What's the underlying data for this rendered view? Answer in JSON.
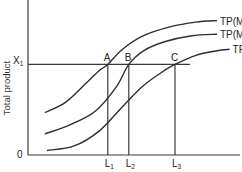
{
  "chart_data": {
    "type": "line",
    "title": "",
    "xlabel": "",
    "ylabel": "Total product",
    "origin_label": "0",
    "grid": false,
    "legend": "none",
    "x_range": [
      0,
      10
    ],
    "y_range": [
      0,
      10
    ],
    "level_line": {
      "label": "X",
      "subscript": "1",
      "y": 6
    },
    "series": [
      {
        "name": "TP(M3)",
        "label_main": "TP(M",
        "label_sub": "3",
        "label_end": ")",
        "points": [
          [
            0.8,
            2.8
          ],
          [
            1.8,
            3.5
          ],
          [
            2.8,
            4.8
          ],
          [
            3.4,
            5.6
          ],
          [
            3.8,
            6.0
          ],
          [
            4.5,
            7.0
          ],
          [
            5.5,
            7.9
          ],
          [
            6.8,
            8.5
          ],
          [
            8.0,
            8.8
          ],
          [
            9.0,
            8.9
          ]
        ]
      },
      {
        "name": "TP(M2)",
        "label_main": "TP(M",
        "label_sub": "2",
        "label_end": ")",
        "points": [
          [
            0.8,
            1.4
          ],
          [
            2.0,
            2.0
          ],
          [
            3.2,
            2.9
          ],
          [
            4.2,
            4.5
          ],
          [
            4.8,
            6.0
          ],
          [
            5.5,
            6.9
          ],
          [
            6.5,
            7.5
          ],
          [
            7.8,
            7.9
          ],
          [
            9.0,
            8.0
          ]
        ]
      },
      {
        "name": "TP(M1)",
        "label_main": "TP(M",
        "label_sub": "1",
        "label_end": ")",
        "points": [
          [
            0.9,
            0.3
          ],
          [
            2.2,
            0.6
          ],
          [
            3.4,
            1.6
          ],
          [
            4.5,
            3.2
          ],
          [
            5.5,
            4.6
          ],
          [
            6.5,
            5.6
          ],
          [
            7.0,
            6.0
          ],
          [
            8.0,
            6.6
          ],
          [
            9.0,
            6.9
          ],
          [
            9.6,
            7.0
          ]
        ]
      }
    ],
    "intersections": [
      {
        "label": "A",
        "x": 3.8,
        "y": 6,
        "x_label": "L",
        "x_sub": "1"
      },
      {
        "label": "B",
        "x": 4.8,
        "y": 6,
        "x_label": "L",
        "x_sub": "2"
      },
      {
        "label": "C",
        "x": 7.0,
        "y": 6,
        "x_label": "L",
        "x_sub": "3"
      }
    ]
  }
}
